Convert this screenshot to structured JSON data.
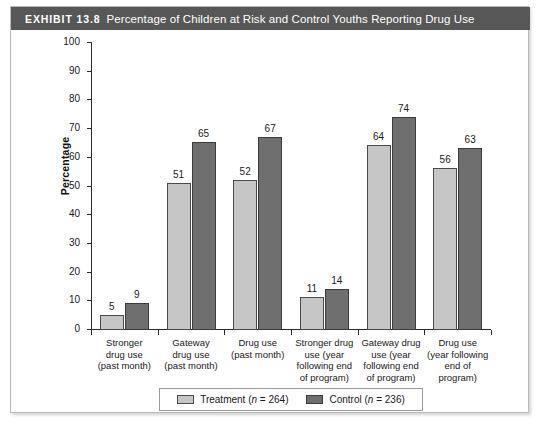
{
  "exhibit": {
    "tag": "EXHIBIT 13.8",
    "title": "Percentage of Children at Risk and Control Youths Reporting Drug Use"
  },
  "legend": {
    "treatment_label": "Treatment (n = 264)",
    "control_label": "Control (n = 236)"
  },
  "chart_data": {
    "type": "bar",
    "title": "Percentage of Children at Risk and Control Youths Reporting Drug Use",
    "xlabel": "",
    "ylabel": "Percentage",
    "ylim": [
      0,
      100
    ],
    "yticks": [
      0,
      10,
      20,
      30,
      40,
      50,
      60,
      70,
      80,
      90,
      100
    ],
    "grid": false,
    "legend_position": "bottom",
    "categories": [
      "Stronger drug use (past month)",
      "Gateway drug use (past month)",
      "Drug use (past month)",
      "Stronger drug use (year following end of program)",
      "Gateway drug use (year following end of program)",
      "Drug use (year following end of program)"
    ],
    "category_lines": [
      [
        "Stronger",
        "drug use",
        "(past month)"
      ],
      [
        "Gateway",
        "drug use",
        "(past month)"
      ],
      [
        "Drug use",
        "(past month)"
      ],
      [
        "Stronger drug",
        "use (year",
        "following end",
        "of program)"
      ],
      [
        "Gateway drug",
        "use (year",
        "following end",
        "of program)"
      ],
      [
        "Drug use",
        "(year following",
        "end of",
        "program)"
      ]
    ],
    "series": [
      {
        "name": "Treatment (n = 264)",
        "color": "#c6c6c6",
        "values": [
          5,
          51,
          52,
          11,
          64,
          56
        ]
      },
      {
        "name": "Control (n = 236)",
        "color": "#6f6f6f",
        "values": [
          9,
          65,
          67,
          14,
          74,
          63
        ]
      }
    ]
  }
}
